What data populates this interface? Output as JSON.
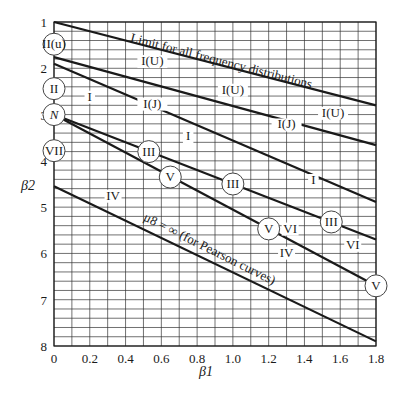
{
  "chart_data": {
    "type": "line",
    "title": "",
    "xlabel": "β1",
    "ylabel": "β2",
    "xlim": [
      0,
      1.8
    ],
    "ylim": [
      8,
      1
    ],
    "y_inverted": true,
    "grid": true,
    "x_ticks": [
      "0",
      "0.2",
      "0.4",
      "0.6",
      "0.8",
      "1.0",
      "1.2",
      "1.4",
      "1.6",
      "1.8"
    ],
    "y_ticks": [
      "1",
      "2",
      "3",
      "4",
      "5",
      "6",
      "7",
      "8"
    ],
    "series": [
      {
        "name": "Limit for all frequency distributions",
        "points": [
          [
            0,
            1.0
          ],
          [
            1.8,
            2.8
          ]
        ]
      },
      {
        "name": "I(U) / I(J) boundary",
        "points": [
          [
            0,
            1.76
          ],
          [
            1.8,
            3.66
          ]
        ]
      },
      {
        "name": "I(J) / I boundary",
        "points": [
          [
            0,
            1.9
          ],
          [
            1.8,
            4.89
          ]
        ]
      },
      {
        "name": "Type III line",
        "points": [
          [
            0,
            3.0
          ],
          [
            1.8,
            5.7
          ]
        ]
      },
      {
        "name": "Type V line",
        "points": [
          [
            0,
            3.0
          ],
          [
            1.8,
            6.7
          ]
        ]
      },
      {
        "name": "μ8 = ∞ (for Pearson curves)",
        "points": [
          [
            0,
            4.55
          ],
          [
            1.8,
            7.9
          ]
        ]
      }
    ],
    "annotations": {
      "line_labels": [
        {
          "text": "Limit for all frequency distributions",
          "x": 0.93,
          "y": 1.93,
          "angle": 14.5
        },
        {
          "text": "μ8 = ∞ (for Pearson curves)",
          "x": 0.86,
          "y": 5.98,
          "angle": 26.5
        }
      ],
      "region_labels": [
        {
          "text": "I(U)",
          "x": 0.55,
          "y": 1.93
        },
        {
          "text": "I(U)",
          "x": 1.0,
          "y": 2.55
        },
        {
          "text": "I(U)",
          "x": 1.56,
          "y": 3.05
        },
        {
          "text": "I(J)",
          "x": 0.55,
          "y": 2.85
        },
        {
          "text": "I(J)",
          "x": 1.3,
          "y": 3.3
        },
        {
          "text": "I",
          "x": 0.2,
          "y": 2.7
        },
        {
          "text": "I",
          "x": 0.75,
          "y": 3.55
        },
        {
          "text": "I",
          "x": 1.45,
          "y": 4.5
        },
        {
          "text": "IV",
          "x": 0.33,
          "y": 4.84
        },
        {
          "text": "IV",
          "x": 1.3,
          "y": 6.07
        },
        {
          "text": "VI",
          "x": 1.32,
          "y": 5.55
        },
        {
          "text": "VI",
          "x": 1.67,
          "y": 5.9
        }
      ],
      "point_labels": [
        {
          "text": "II(u)",
          "x": 0,
          "y": 1.48
        },
        {
          "text": "II",
          "x": 0,
          "y": 2.44
        },
        {
          "text": "N",
          "x": 0,
          "y": 3.0
        },
        {
          "text": "VII",
          "x": 0,
          "y": 3.78
        },
        {
          "text": "III",
          "x": 0.53,
          "y": 3.8
        },
        {
          "text": "V",
          "x": 0.65,
          "y": 4.35
        },
        {
          "text": "III",
          "x": 1.0,
          "y": 4.5
        },
        {
          "text": "V",
          "x": 1.2,
          "y": 5.47
        },
        {
          "text": "III",
          "x": 1.55,
          "y": 5.32
        },
        {
          "text": "V",
          "x": 1.8,
          "y": 6.7
        }
      ]
    }
  }
}
